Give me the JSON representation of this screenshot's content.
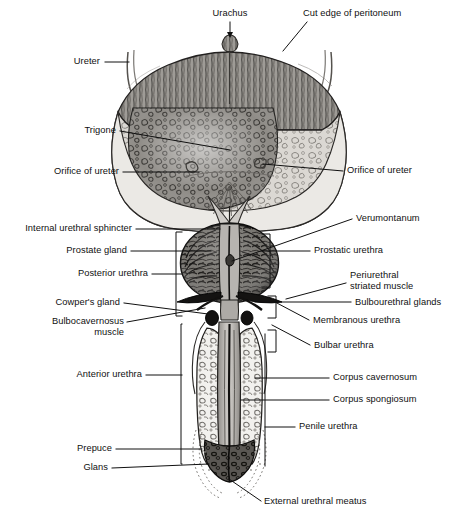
{
  "figure": {
    "type": "anatomical-illustration",
    "background_color": "#ffffff",
    "line_color": "#101010",
    "width": 459,
    "height": 517
  },
  "labels": {
    "urachus": "Urachus",
    "cut_edge_of_peritoneum": "Cut edge of peritoneum",
    "ureter": "Ureter",
    "trigone": "Trigone",
    "orifice_of_ureter_left": "Orifice of ureter",
    "orifice_of_ureter_right": "Orifice of ureter",
    "internal_urethral_sphincter": "Internal urethral sphincter",
    "verumontanum": "Verumontanum",
    "prostate_gland": "Prostate gland",
    "prostatic_urethra": "Prostatic urethra",
    "posterior_urethra": "Posterior urethra",
    "periurethral_striated_muscle_line1": "Periurethral",
    "periurethral_striated_muscle_line2": "striated muscle",
    "cowpers_gland": "Cowper's gland",
    "bulbourethral_glands": "Bulbourethral glands",
    "bulbocavernosus_muscle_line1": "Bulbocavernosus",
    "bulbocavernosus_muscle_line2": "muscle",
    "membranous_urethra": "Membranous urethra",
    "bulbar_urethra": "Bulbar urethra",
    "anterior_urethra": "Anterior urethra",
    "corpus_cavernosum": "Corpus cavernosum",
    "corpus_spongiosum": "Corpus spongiosum",
    "penile_urethra": "Penile urethra",
    "prepuce": "Prepuce",
    "glans": "Glans",
    "external_urethral_meatus": "External urethral meatus"
  },
  "structures": {
    "bladder": "urinary-bladder",
    "bladder_dome": "detrusor-muscle-wall",
    "bladder_mucosa": "trabeculated-bladder-mucosa",
    "prostate": "prostate-gland-mass",
    "penile_shaft": "penile-shaft-cross-section",
    "corpora": "paired-corpora-cavernosa",
    "spongiosum": "corpus-spongiosum-column",
    "glans_tip": "glans-penis"
  },
  "palette": {
    "ink": "#101010",
    "tissue_light": "#e8e6e2",
    "tissue_mid": "#b9b6b1",
    "tissue_dark": "#6e6b67",
    "tissue_darkest": "#2a2826",
    "shadow": "#8d8a86"
  }
}
